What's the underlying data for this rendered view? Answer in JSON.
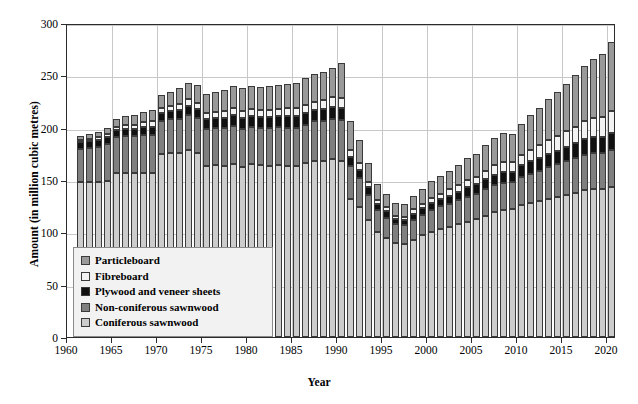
{
  "chart_data": {
    "type": "bar",
    "subtype": "stacked-bar",
    "title": "",
    "xlabel": "Year",
    "ylabel": "Amount (in million cubic metres)",
    "ylim": [
      0,
      300
    ],
    "ytick_step": 50,
    "yticks": [
      0,
      50,
      100,
      150,
      200,
      250,
      300
    ],
    "xlim": [
      1960,
      2021
    ],
    "xticks": [
      1960,
      1965,
      1970,
      1975,
      1980,
      1985,
      1990,
      1995,
      2000,
      2005,
      2010,
      2015,
      2020
    ],
    "grid": "horizontal-and-vertical",
    "legend_position": "inside-lower-left",
    "categories": [
      1961,
      1962,
      1963,
      1964,
      1965,
      1966,
      1967,
      1968,
      1969,
      1970,
      1971,
      1972,
      1973,
      1974,
      1975,
      1976,
      1977,
      1978,
      1979,
      1980,
      1981,
      1982,
      1983,
      1984,
      1985,
      1986,
      1987,
      1988,
      1989,
      1990,
      1991,
      1992,
      1993,
      1994,
      1995,
      1996,
      1997,
      1998,
      1999,
      2000,
      2001,
      2002,
      2003,
      2004,
      2005,
      2006,
      2007,
      2008,
      2009,
      2010,
      2011,
      2012,
      2013,
      2014,
      2015,
      2016,
      2017,
      2018,
      2019,
      2020
    ],
    "series": [
      {
        "name": "Coniferous sawnwood",
        "color": "#cccccc",
        "values": [
          148,
          148,
          148,
          149,
          157,
          157,
          157,
          157,
          157,
          175,
          176,
          176,
          179,
          176,
          163,
          164,
          163,
          165,
          162,
          165,
          164,
          163,
          164,
          163,
          163,
          166,
          168,
          168,
          170,
          168,
          132,
          124,
          112,
          100,
          95,
          90,
          89,
          93,
          97,
          100,
          103,
          105,
          108,
          110,
          113,
          116,
          119,
          121,
          122,
          126,
          128,
          130,
          132,
          134,
          136,
          138,
          140,
          141,
          141,
          143
        ]
      },
      {
        "name": "Non-coniferous sawnwood",
        "color": "#7f7f7f",
        "values": [
          32,
          33,
          34,
          35,
          34,
          35,
          35,
          36,
          36,
          31,
          32,
          32,
          33,
          33,
          36,
          36,
          37,
          37,
          37,
          36,
          36,
          37,
          37,
          37,
          37,
          37,
          38,
          38,
          38,
          39,
          31,
          28,
          24,
          21,
          19,
          18,
          18,
          19,
          20,
          21,
          22,
          22,
          23,
          24,
          24,
          25,
          26,
          26,
          26,
          27,
          28,
          29,
          30,
          31,
          32,
          33,
          34,
          35,
          35,
          36
        ]
      },
      {
        "name": "Plywood and veneer sheets",
        "color": "#111111",
        "values": [
          6,
          6,
          6,
          7,
          7,
          7,
          7,
          8,
          8,
          8,
          8,
          9,
          9,
          9,
          9,
          9,
          9,
          10,
          10,
          10,
          10,
          10,
          10,
          11,
          11,
          11,
          11,
          12,
          12,
          12,
          9,
          8,
          7,
          6,
          6,
          5,
          5,
          6,
          6,
          7,
          7,
          8,
          8,
          9,
          9,
          10,
          10,
          11,
          10,
          11,
          12,
          12,
          13,
          13,
          14,
          14,
          15,
          15,
          15,
          16
        ]
      },
      {
        "name": "Fibreboard",
        "color": "#f2f2f2",
        "values": [
          2,
          2,
          3,
          3,
          3,
          4,
          4,
          4,
          5,
          5,
          5,
          6,
          6,
          6,
          6,
          6,
          7,
          7,
          7,
          7,
          7,
          7,
          7,
          8,
          8,
          8,
          8,
          8,
          9,
          9,
          7,
          6,
          5,
          4,
          4,
          3,
          3,
          4,
          4,
          5,
          5,
          6,
          6,
          7,
          7,
          8,
          9,
          9,
          9,
          10,
          11,
          12,
          13,
          14,
          15,
          16,
          17,
          18,
          19,
          21
        ]
      },
      {
        "name": "Particleboard",
        "color": "#999999",
        "values": [
          4,
          5,
          5,
          6,
          7,
          8,
          9,
          10,
          11,
          12,
          13,
          15,
          16,
          17,
          18,
          19,
          20,
          21,
          22,
          22,
          22,
          23,
          23,
          23,
          24,
          25,
          26,
          27,
          28,
          34,
          27,
          22,
          18,
          15,
          13,
          12,
          12,
          13,
          14,
          16,
          17,
          18,
          19,
          21,
          22,
          24,
          26,
          28,
          27,
          30,
          33,
          36,
          39,
          42,
          45,
          49,
          53,
          57,
          60,
          66
        ]
      }
    ]
  },
  "axis": {
    "y_title": "Amount (in million cubic metres)",
    "x_title": "Year",
    "y_tick_labels": [
      "0",
      "50",
      "100",
      "150",
      "200",
      "250",
      "300"
    ],
    "x_tick_labels": [
      "1960",
      "1965",
      "1970",
      "1975",
      "1980",
      "1985",
      "1990",
      "1995",
      "2000",
      "2005",
      "2010",
      "2015",
      "2020"
    ]
  },
  "legend": {
    "items": [
      {
        "label": "Particleboard",
        "color": "#999999"
      },
      {
        "label": "Fibreboard",
        "color": "#f2f2f2"
      },
      {
        "label": "Plywood and veneer sheets",
        "color": "#111111"
      },
      {
        "label": "Non-coniferous sawnwood",
        "color": "#7f7f7f"
      },
      {
        "label": "Coniferous sawnwood",
        "color": "#cccccc"
      }
    ]
  }
}
